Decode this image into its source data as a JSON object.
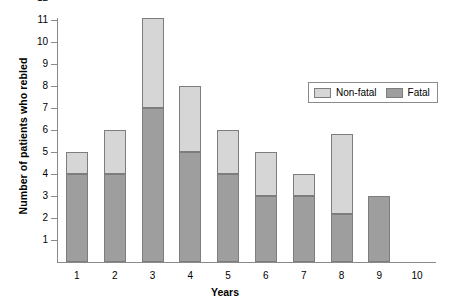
{
  "chart_data": {
    "type": "bar",
    "subtype": "stacked-bar",
    "title": "",
    "xlabel": "Years",
    "ylabel": "Number of patients who rebled",
    "categories": [
      "1",
      "2",
      "3",
      "4",
      "5",
      "6",
      "7",
      "8",
      "9",
      "10"
    ],
    "series": [
      {
        "name": "Fatal",
        "color": "#9e9e9e",
        "values": [
          4,
          4,
          7,
          5,
          4,
          3,
          3,
          2.2,
          3,
          0
        ]
      },
      {
        "name": "Non-fatal",
        "color": "#d6d6d6",
        "values": [
          1,
          2,
          4.1,
          3,
          2,
          2,
          1,
          3.6,
          0,
          0
        ]
      }
    ],
    "totals": [
      5,
      6,
      11.1,
      8,
      6,
      5,
      4,
      5.8,
      3,
      0
    ],
    "ylim": [
      0,
      12
    ],
    "yticks": [
      1,
      2,
      3,
      4,
      5,
      6,
      7,
      8,
      9,
      10,
      11,
      12
    ],
    "ytick_labels": [
      "1",
      "2",
      "3",
      "4",
      "5",
      "6",
      "7",
      "8",
      "9",
      "10",
      "11",
      "12"
    ],
    "grid": false,
    "legend_position": "top-right",
    "legend_entries": [
      "Non-fatal",
      "Fatal"
    ]
  },
  "legend": {
    "nonfatal_label": "Non-fatal",
    "fatal_label": "Fatal"
  },
  "axes": {
    "x_title": "Years",
    "y_title": "Number of patients who rebled"
  }
}
